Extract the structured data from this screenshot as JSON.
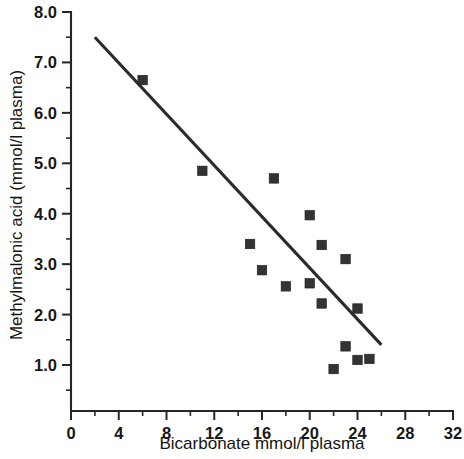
{
  "chart_data": {
    "type": "scatter",
    "title": "",
    "xlabel": "Bicarbonate mmol/l plasma",
    "ylabel": "Methylmalonic acid (mmol/l plasma)",
    "xlim": [
      0,
      32
    ],
    "ylim": [
      0.0,
      8.0
    ],
    "x_ticks": [
      0,
      4,
      8,
      12,
      16,
      20,
      24,
      28,
      32
    ],
    "x_tick_labels": [
      "0",
      "4",
      "8",
      "12",
      "16",
      "20",
      "24",
      "28",
      "32"
    ],
    "x_minor_ticks": [
      2,
      6,
      10,
      14,
      18,
      22,
      26,
      30
    ],
    "y_ticks": [
      1.0,
      2.0,
      3.0,
      4.0,
      5.0,
      6.0,
      7.0,
      8.0
    ],
    "y_tick_labels": [
      "1.0",
      "2.0",
      "3.0",
      "4.0",
      "5.0",
      "6.0",
      "7.0",
      "8.0"
    ],
    "y_minor_ticks": [
      0.5,
      1.5,
      2.5,
      3.5,
      4.5,
      5.5,
      6.5,
      7.5
    ],
    "grid": false,
    "legend": null,
    "marker_shape": "filled-square",
    "marker_color": "#333333",
    "series": [
      {
        "name": "Patients",
        "points": [
          {
            "x": 6.0,
            "y": 6.65
          },
          {
            "x": 11.0,
            "y": 4.85
          },
          {
            "x": 15.0,
            "y": 3.4
          },
          {
            "x": 16.0,
            "y": 2.88
          },
          {
            "x": 17.0,
            "y": 4.7
          },
          {
            "x": 18.0,
            "y": 2.56
          },
          {
            "x": 20.0,
            "y": 3.97
          },
          {
            "x": 20.0,
            "y": 2.62
          },
          {
            "x": 21.0,
            "y": 3.38
          },
          {
            "x": 21.0,
            "y": 2.22
          },
          {
            "x": 22.0,
            "y": 0.92
          },
          {
            "x": 23.0,
            "y": 3.1
          },
          {
            "x": 23.0,
            "y": 1.37
          },
          {
            "x": 24.0,
            "y": 2.12
          },
          {
            "x": 24.0,
            "y": 1.1
          },
          {
            "x": 25.0,
            "y": 1.12
          }
        ]
      }
    ],
    "trend_line": {
      "name": "regression-line",
      "color": "#2b2b2b",
      "x_start": 2.0,
      "y_start": 7.5,
      "x_end": 26.0,
      "y_end": 1.4
    }
  }
}
